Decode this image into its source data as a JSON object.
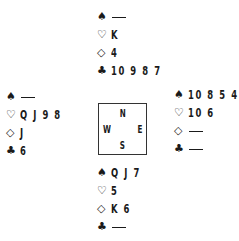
{
  "suits": {
    "spades": "♠",
    "hearts": "♡",
    "diamonds": "◇",
    "clubs": "♣"
  },
  "compass": {
    "north": "N",
    "south": "S",
    "west": "W",
    "east": "E"
  },
  "hands": {
    "north": {
      "spades": "",
      "hearts": "K",
      "diamonds": "4",
      "clubs": "10 9 8 7"
    },
    "west": {
      "spades": "",
      "hearts": "Q J 9 8",
      "diamonds": "J",
      "clubs": "6"
    },
    "east": {
      "spades": "10 8 5 4",
      "hearts": "10 6",
      "diamonds": "",
      "clubs": ""
    },
    "south": {
      "spades": "Q J 7",
      "hearts": "5",
      "diamonds": "K 6",
      "clubs": ""
    }
  },
  "void_symbol": "—"
}
